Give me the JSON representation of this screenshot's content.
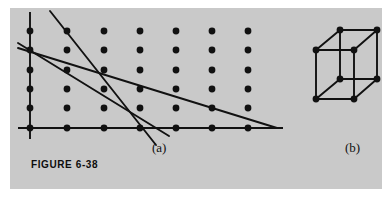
{
  "figure": {
    "caption": "FIGURE 6-38",
    "panel_background": "#c9c9c9",
    "page_background": "#ffffff",
    "ink_color": "#111111",
    "subfigures": [
      {
        "id": "a",
        "label": "(a)",
        "kind": "2d-lattice-with-lines"
      },
      {
        "id": "b",
        "label": "(b)",
        "kind": "3d-cube-lattice"
      }
    ]
  },
  "lattice_a": {
    "description": "Two-dimensional point lattice of 7 columns by 6 rows with axes drawn through the leftmost column and bottom row",
    "columns": 7,
    "rows": 6,
    "dot_radius": 3.4,
    "dot_color": "#111111",
    "column_x": [
      30,
      67,
      104,
      140,
      176,
      212,
      248
    ],
    "row_y": [
      31,
      50,
      70,
      89,
      108,
      128
    ],
    "axes": {
      "vertical": {
        "x": 30,
        "y1": 12,
        "y2": 139
      },
      "horizontal": {
        "y": 128,
        "x1": 18,
        "x2": 283
      }
    },
    "lines": [
      {
        "name": "steep-line",
        "x1": 50,
        "y1": 11,
        "x2": 156,
        "y2": 145
      },
      {
        "name": "medium-line",
        "x1": 18,
        "y1": 43,
        "x2": 169,
        "y2": 136
      },
      {
        "name": "shallow-line",
        "x1": 18,
        "y1": 48,
        "x2": 277,
        "y2": 128
      }
    ]
  },
  "lattice_b": {
    "description": "Cubic unit cell with eight lattice points at the cube corners",
    "dot_radius": 3.4,
    "dot_color": "#111111",
    "vertices": [
      {
        "name": "front-top-left",
        "x": 316,
        "y": 50
      },
      {
        "name": "front-top-right",
        "x": 354,
        "y": 50
      },
      {
        "name": "front-bottom-left",
        "x": 316,
        "y": 99
      },
      {
        "name": "front-bottom-right",
        "x": 354,
        "y": 99
      },
      {
        "name": "back-top-left",
        "x": 340,
        "y": 30
      },
      {
        "name": "back-top-right",
        "x": 377,
        "y": 30
      },
      {
        "name": "back-bottom-left",
        "x": 340,
        "y": 79
      },
      {
        "name": "back-bottom-right",
        "x": 377,
        "y": 79
      }
    ],
    "edges": [
      [
        "front-top-left",
        "front-top-right"
      ],
      [
        "front-top-right",
        "front-bottom-right"
      ],
      [
        "front-bottom-right",
        "front-bottom-left"
      ],
      [
        "front-bottom-left",
        "front-top-left"
      ],
      [
        "back-top-left",
        "back-top-right"
      ],
      [
        "back-top-right",
        "back-bottom-right"
      ],
      [
        "back-bottom-right",
        "back-bottom-left"
      ],
      [
        "back-bottom-left",
        "back-top-left"
      ],
      [
        "front-top-left",
        "back-top-left"
      ],
      [
        "front-top-right",
        "back-top-right"
      ],
      [
        "front-bottom-left",
        "back-bottom-left"
      ],
      [
        "front-bottom-right",
        "back-bottom-right"
      ]
    ]
  }
}
